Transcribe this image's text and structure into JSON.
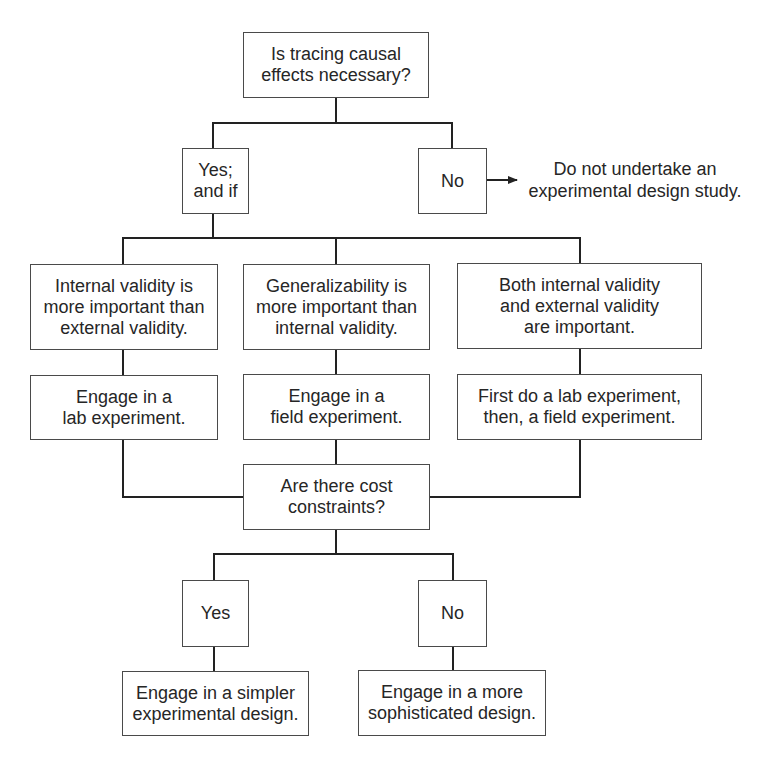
{
  "diagram": {
    "type": "decision-flowchart",
    "colors": {
      "background": "#ffffff",
      "text": "#262626",
      "box_border": "#4a4a4a",
      "connector": "#222222"
    },
    "nodes": {
      "q1": "Is tracing causal\neffects necessary?",
      "yes1": "Yes;\nand if",
      "no1": "No",
      "stop": "Do not undertake an\nexperimental design study.",
      "cond_internal": "Internal validity is\nmore important than\nexternal validity.",
      "cond_general": "Generalizability is\nmore important than\ninternal validity.",
      "cond_both": "Both internal validity\nand external validity\nare important.",
      "action_lab": "Engage in a\nlab experiment.",
      "action_field": "Engage in a\nfield experiment.",
      "action_both": "First do a lab experiment,\nthen, a field experiment.",
      "q2": "Are there cost\nconstraints?",
      "yes2": "Yes",
      "no2": "No",
      "final_simple": "Engage in a simpler\nexperimental design.",
      "final_sophisticated": "Engage in a more\nsophisticated design."
    },
    "edges": [
      {
        "from": "q1",
        "to": "yes1"
      },
      {
        "from": "q1",
        "to": "no1"
      },
      {
        "from": "no1",
        "to": "stop",
        "arrow": true
      },
      {
        "from": "yes1",
        "to": "cond_internal"
      },
      {
        "from": "yes1",
        "to": "cond_general"
      },
      {
        "from": "yes1",
        "to": "cond_both"
      },
      {
        "from": "cond_internal",
        "to": "action_lab"
      },
      {
        "from": "cond_general",
        "to": "action_field"
      },
      {
        "from": "cond_both",
        "to": "action_both"
      },
      {
        "from": "action_lab",
        "to": "q2"
      },
      {
        "from": "action_field",
        "to": "q2"
      },
      {
        "from": "action_both",
        "to": "q2"
      },
      {
        "from": "q2",
        "to": "yes2"
      },
      {
        "from": "q2",
        "to": "no2"
      },
      {
        "from": "yes2",
        "to": "final_simple"
      },
      {
        "from": "no2",
        "to": "final_sophisticated"
      }
    ]
  }
}
